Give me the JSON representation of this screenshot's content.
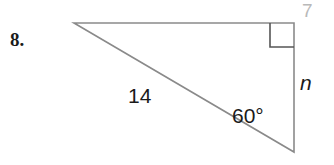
{
  "figure": {
    "problem_number": "8.",
    "page_artifact": "7",
    "line_color": "#8a8a8a",
    "text_color": "#1a1a1a",
    "artifact_color": "#b9b9b9",
    "background": "#ffffff"
  },
  "geometry": {
    "type": "right-triangle",
    "vertices": {
      "left": {
        "x": 74,
        "y": 23
      },
      "top_right": {
        "x": 294,
        "y": 23
      },
      "bottom_right": {
        "x": 294,
        "y": 152
      }
    },
    "right_angle_marker": {
      "at_vertex": "top_right",
      "size": 24
    }
  },
  "labels": {
    "hypotenuse": "14",
    "angle": "60°",
    "opposite_side": "n"
  }
}
